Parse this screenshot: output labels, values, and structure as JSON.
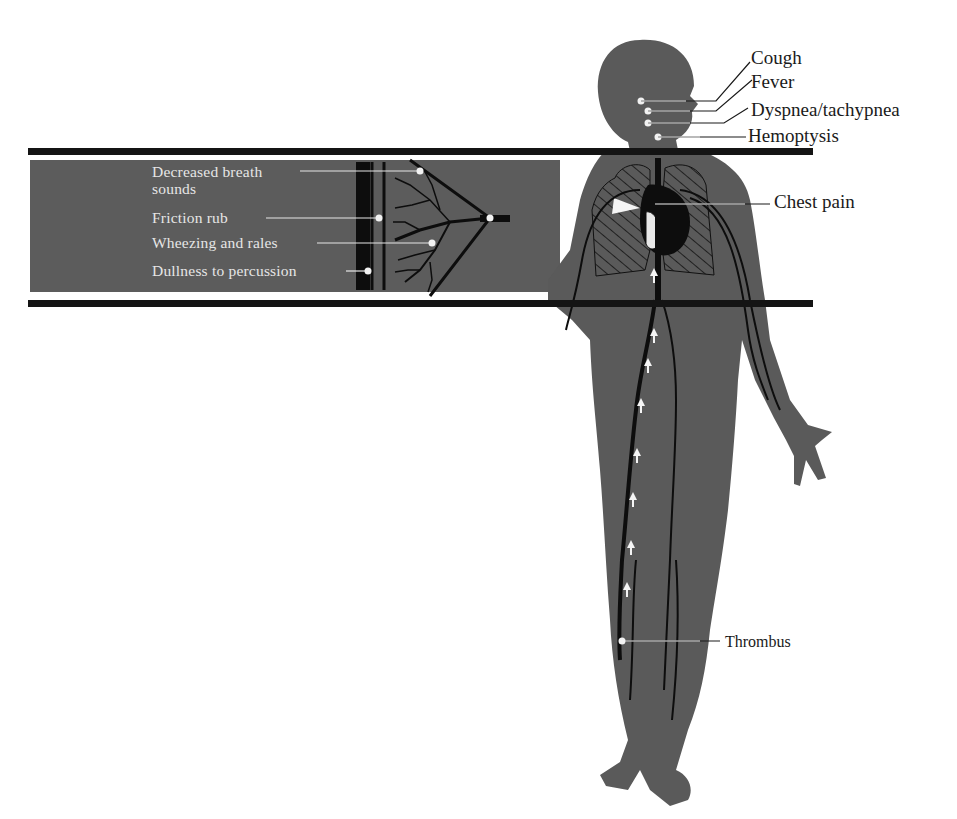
{
  "figure": {
    "colors": {
      "background": "#ffffff",
      "silhouette": "#5a5a5a",
      "band": "#5c5c5c",
      "rule": "#141414",
      "vessel": "#0d0d0d",
      "marker": "#f2f2f2",
      "light_text": "#e6e6e6",
      "dark_text": "#1a1a1a"
    }
  },
  "head_labels": [
    {
      "text": "Cough"
    },
    {
      "text": "Fever"
    },
    {
      "text": "Dyspnea/tachypnea"
    },
    {
      "text": "Hemoptysis"
    }
  ],
  "chest_label": {
    "text": "Chest pain"
  },
  "thrombus_label": {
    "text": "Thrombus"
  },
  "lung_inset_labels": [
    {
      "text_line1": "Decreased breath",
      "text_line2": "sounds"
    },
    {
      "text_line1": "Friction rub"
    },
    {
      "text_line1": "Wheezing and rales"
    },
    {
      "text_line1": "Dullness to percussion"
    }
  ]
}
